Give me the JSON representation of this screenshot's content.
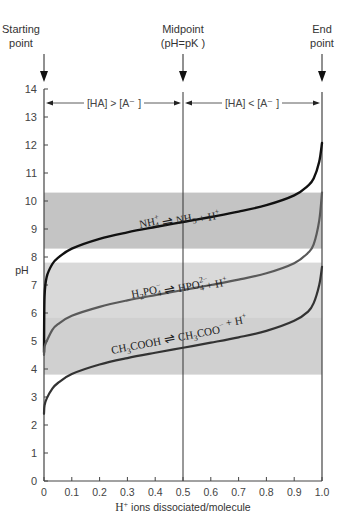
{
  "chart_data": {
    "type": "line",
    "title": "",
    "xlabel": "H+ ions dissociated/molecule",
    "ylabel": "pH",
    "xlim": [
      0,
      1.0
    ],
    "ylim": [
      0,
      14
    ],
    "grid": false,
    "x_ticks": [
      "0",
      "0.1",
      "0.2",
      "0.3",
      "0.4",
      "0.5",
      "0.6",
      "0.7",
      "0.8",
      "0.9",
      "1.0"
    ],
    "y_ticks": [
      "0",
      "1",
      "2",
      "3",
      "4",
      "5",
      "6",
      "7",
      "8",
      "9",
      "10",
      "11",
      "12",
      "13",
      "14"
    ],
    "annotations": {
      "start": [
        "Starting",
        "point"
      ],
      "mid": [
        "Midpoint",
        "(pH=pK )"
      ],
      "end": [
        "End",
        "point"
      ],
      "left_region": "[HA] > [A⁻ ]",
      "right_region": "[HA] < [A⁻ ]"
    },
    "buffer_bands": [
      {
        "name": "NH4+ / NH3",
        "ph_low": 8.3,
        "ph_high": 10.3,
        "color": "#c4c4c4"
      },
      {
        "name": "H2PO4- / HPO4 2-",
        "ph_low": 5.85,
        "ph_high": 7.8,
        "color": "#d9d9d9"
      },
      {
        "name": "CH3COOH / CH3COO-",
        "ph_low": 3.8,
        "ph_high": 5.85,
        "color": "#d0d0d0"
      }
    ],
    "series": [
      {
        "name": "NH4+ ⇌ NH3 + H+",
        "pK": 9.25,
        "color": "#111111",
        "width": 2.4,
        "x": [
          0,
          0.002,
          0.01,
          0.03,
          0.05,
          0.1,
          0.2,
          0.3,
          0.4,
          0.5,
          0.6,
          0.7,
          0.8,
          0.9,
          0.95,
          0.97,
          0.99,
          1.0
        ],
        "y": [
          4.6,
          6.6,
          7.3,
          7.75,
          7.97,
          8.3,
          8.65,
          8.88,
          9.07,
          9.25,
          9.43,
          9.62,
          9.85,
          10.2,
          10.55,
          10.8,
          11.4,
          12.07
        ]
      },
      {
        "name": "H2PO4- ⇌ HPO4 2- + H+",
        "pK": 6.82,
        "color": "#5a5a5a",
        "width": 2.2,
        "x": [
          0,
          0.002,
          0.01,
          0.03,
          0.05,
          0.1,
          0.2,
          0.3,
          0.4,
          0.5,
          0.6,
          0.7,
          0.8,
          0.9,
          0.95,
          0.97,
          0.99,
          1.0
        ],
        "y": [
          4.5,
          4.8,
          5.0,
          5.4,
          5.6,
          5.9,
          6.22,
          6.45,
          6.64,
          6.82,
          7.0,
          7.19,
          7.42,
          7.78,
          8.15,
          8.45,
          9.3,
          10.3
        ]
      },
      {
        "name": "CH3COOH ⇌ CH3COO- + H+",
        "pK": 4.76,
        "color": "#333333",
        "width": 2.2,
        "x": [
          0,
          0.002,
          0.01,
          0.03,
          0.05,
          0.1,
          0.2,
          0.3,
          0.4,
          0.5,
          0.6,
          0.7,
          0.8,
          0.9,
          0.95,
          0.97,
          0.99,
          1.0
        ],
        "y": [
          2.4,
          2.7,
          2.95,
          3.3,
          3.5,
          3.82,
          4.16,
          4.39,
          4.58,
          4.76,
          4.94,
          5.13,
          5.36,
          5.72,
          6.05,
          6.35,
          7.0,
          7.65
        ]
      }
    ],
    "equation_labels": [
      {
        "left": "NH",
        "left_sub": "4",
        "left_sup": "+",
        "right": "NH",
        "right_sub": "3",
        "tail": " + H",
        "tail_sup": "+"
      },
      {
        "left": "H",
        "left_sub0": "2",
        "left_mid": "PO",
        "left_sub": "4",
        "left_sup": "−",
        "right": "HPO",
        "right_sub": "4",
        "right_sup": "2−",
        "tail": " + H",
        "tail_sup": "+"
      },
      {
        "left": "CH",
        "left_sub0": "3",
        "left_mid": "COOH",
        "right": "CH",
        "right_sub0": "3",
        "right_mid": "COO",
        "right_sup": "−",
        "tail": " + H",
        "tail_sup": "+"
      }
    ],
    "xlabel_parts": {
      "h": "H",
      "sup": "+",
      "rest": " ions dissociated/molecule"
    }
  }
}
